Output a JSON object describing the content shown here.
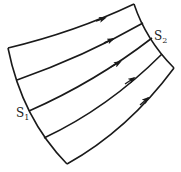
{
  "diagram": {
    "labels": {
      "s1": {
        "main": "S",
        "sub": "1"
      },
      "s2": {
        "main": "S",
        "sub": "2"
      }
    },
    "streamline_count": 5,
    "colors": {
      "stroke": "#1a1a1a",
      "background": "#ffffff"
    }
  }
}
